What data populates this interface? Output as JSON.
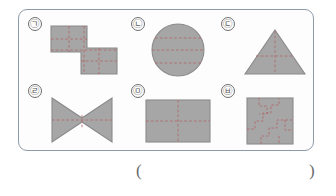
{
  "worksheet": {
    "answer_blank": {
      "open_paren": "(",
      "close_paren": ")",
      "value": ""
    }
  },
  "palette": {
    "shape_fill": "#a6a6a6",
    "shape_stroke": "#8a8a8a",
    "dash_line": "#b06a6a",
    "panel_border": "#8d9ba8",
    "label_text": "#5a5a5a",
    "page_background": "#ffffff",
    "panel_background": "#fdfdfd"
  },
  "shapes": [
    {
      "id": "shape-a",
      "label": "㉠",
      "label_name": "circled-giyeok",
      "figure": "z-shaped-hexomino",
      "dashed_lines": [
        "vertical-left",
        "vertical-right",
        "horizontal-mid"
      ]
    },
    {
      "id": "shape-b",
      "label": "㉡",
      "label_name": "circled-nieun",
      "figure": "circle",
      "dashed_lines": [
        "horizontal-upper",
        "horizontal-center",
        "horizontal-lower"
      ]
    },
    {
      "id": "shape-c",
      "label": "㉢",
      "label_name": "circled-digeut",
      "figure": "triangle",
      "dashed_lines": [
        "vertical-center",
        "horizontal-mid"
      ]
    },
    {
      "id": "shape-d",
      "label": "㉣",
      "label_name": "circled-rieul",
      "figure": "bowtie",
      "dashed_lines": [
        "horizontal-center",
        "vertical-center"
      ]
    },
    {
      "id": "shape-e",
      "label": "㉤",
      "label_name": "circled-mieum",
      "figure": "rectangle",
      "dashed_lines": [
        "horizontal-center",
        "vertical-center"
      ]
    },
    {
      "id": "shape-f",
      "label": "㉥",
      "label_name": "circled-bieup",
      "figure": "square",
      "dashed_lines": [
        "zigzag-staircase-path"
      ]
    }
  ]
}
